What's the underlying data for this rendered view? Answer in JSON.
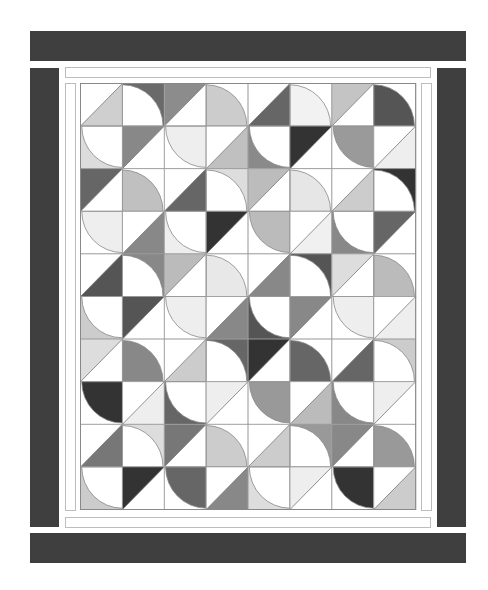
{
  "quilt": {
    "title": "Drunkard's-path style quilt layout",
    "outer_border_color": "#3f3f3f",
    "strip_border_color": "#bdbdbd",
    "grid_line_color": "#9a9a9a",
    "cols": 8,
    "rows": 10,
    "cell_w": 41.9,
    "cell_h": 42.6,
    "legend_types": {
      "HL": "half-square triangle, lower-right colored",
      "HU": "half-square triangle, upper-left colored",
      "QB": "quarter circle centered bottom-left",
      "QT": "quarter circle centered top-right"
    },
    "cells": [
      [
        {
          "t": "HL",
          "c": "#cfcfcf"
        },
        {
          "t": "QB",
          "bg": "#6a6a6a",
          "c": "#ffffff"
        },
        {
          "t": "HU",
          "c": "#8c8c8c"
        },
        {
          "t": "QB",
          "bg": "#ffffff",
          "c": "#cccccc"
        },
        {
          "t": "HL",
          "c": "#666666"
        },
        {
          "t": "QB",
          "bg": "#ffffff",
          "c": "#f2f2f2"
        },
        {
          "t": "HU",
          "c": "#c4c4c4"
        },
        {
          "t": "QB",
          "bg": "#ffffff",
          "c": "#555555"
        }
      ],
      [
        {
          "t": "QT",
          "bg": "#dcdcdc",
          "c": "#ffffff"
        },
        {
          "t": "HU",
          "c": "#888888"
        },
        {
          "t": "QT",
          "bg": "#ffffff",
          "c": "#eeeeee"
        },
        {
          "t": "HL",
          "c": "#c0c0c0"
        },
        {
          "t": "QT",
          "bg": "#8a8a8a",
          "c": "#ffffff"
        },
        {
          "t": "HU",
          "c": "#333333"
        },
        {
          "t": "QT",
          "bg": "#ffffff",
          "c": "#9a9a9a"
        },
        {
          "t": "HL",
          "c": "#eeeeee"
        }
      ],
      [
        {
          "t": "HU",
          "c": "#666666"
        },
        {
          "t": "QB",
          "bg": "#ffffff",
          "c": "#c0c0c0"
        },
        {
          "t": "HL",
          "c": "#666666"
        },
        {
          "t": "QB",
          "bg": "#dddddd",
          "c": "#ffffff"
        },
        {
          "t": "HU",
          "c": "#bcbcbc"
        },
        {
          "t": "QB",
          "bg": "#ffffff",
          "c": "#e6e6e6"
        },
        {
          "t": "HL",
          "c": "#cccccc"
        },
        {
          "t": "QB",
          "bg": "#333333",
          "c": "#ffffff"
        }
      ],
      [
        {
          "t": "QT",
          "bg": "#ffffff",
          "c": "#eeeeee"
        },
        {
          "t": "HL",
          "c": "#888888"
        },
        {
          "t": "QT",
          "bg": "#eeeeee",
          "c": "#ffffff"
        },
        {
          "t": "HU",
          "c": "#333333"
        },
        {
          "t": "QT",
          "bg": "#ffffff",
          "c": "#bbbbbb"
        },
        {
          "t": "HL",
          "c": "#f0f0f0"
        },
        {
          "t": "QT",
          "bg": "#888888",
          "c": "#ffffff"
        },
        {
          "t": "HU",
          "c": "#666666"
        }
      ],
      [
        {
          "t": "HL",
          "c": "#555555"
        },
        {
          "t": "QB",
          "bg": "#888888",
          "c": "#ffffff"
        },
        {
          "t": "HU",
          "c": "#bbbbbb"
        },
        {
          "t": "QB",
          "bg": "#ffffff",
          "c": "#e8e8e8"
        },
        {
          "t": "HL",
          "c": "#888888"
        },
        {
          "t": "QB",
          "bg": "#555555",
          "c": "#ffffff"
        },
        {
          "t": "HU",
          "c": "#dddddd"
        },
        {
          "t": "QB",
          "bg": "#ffffff",
          "c": "#bbbbbb"
        }
      ],
      [
        {
          "t": "QT",
          "bg": "#cccccc",
          "c": "#ffffff"
        },
        {
          "t": "HU",
          "c": "#555555"
        },
        {
          "t": "QT",
          "bg": "#ffffff",
          "c": "#eeeeee"
        },
        {
          "t": "HL",
          "c": "#888888"
        },
        {
          "t": "QT",
          "bg": "#555555",
          "c": "#ffffff"
        },
        {
          "t": "HU",
          "c": "#888888"
        },
        {
          "t": "QT",
          "bg": "#ffffff",
          "c": "#eeeeee"
        },
        {
          "t": "HL",
          "c": "#eeeeee"
        }
      ],
      [
        {
          "t": "HU",
          "c": "#dddddd"
        },
        {
          "t": "QB",
          "bg": "#ffffff",
          "c": "#888888"
        },
        {
          "t": "HL",
          "c": "#cccccc"
        },
        {
          "t": "QB",
          "bg": "#666666",
          "c": "#ffffff"
        },
        {
          "t": "HU",
          "c": "#333333"
        },
        {
          "t": "QB",
          "bg": "#ffffff",
          "c": "#666666"
        },
        {
          "t": "HL",
          "c": "#666666"
        },
        {
          "t": "QB",
          "bg": "#cccccc",
          "c": "#ffffff"
        }
      ],
      [
        {
          "t": "QT",
          "bg": "#ffffff",
          "c": "#333333"
        },
        {
          "t": "HL",
          "c": "#eeeeee"
        },
        {
          "t": "QT",
          "bg": "#666666",
          "c": "#ffffff"
        },
        {
          "t": "HU",
          "c": "#eeeeee"
        },
        {
          "t": "QT",
          "bg": "#ffffff",
          "c": "#999999"
        },
        {
          "t": "HL",
          "c": "#bbbbbb"
        },
        {
          "t": "QT",
          "bg": "#888888",
          "c": "#ffffff"
        },
        {
          "t": "HU",
          "c": "#eeeeee"
        }
      ],
      [
        {
          "t": "HL",
          "c": "#777777"
        },
        {
          "t": "QB",
          "bg": "#dddddd",
          "c": "#ffffff"
        },
        {
          "t": "HU",
          "c": "#777777"
        },
        {
          "t": "QB",
          "bg": "#ffffff",
          "c": "#cccccc"
        },
        {
          "t": "HL",
          "c": "#cccccc"
        },
        {
          "t": "QB",
          "bg": "#999999",
          "c": "#ffffff"
        },
        {
          "t": "HU",
          "c": "#888888"
        },
        {
          "t": "QB",
          "bg": "#ffffff",
          "c": "#999999"
        }
      ],
      [
        {
          "t": "QT",
          "bg": "#cccccc",
          "c": "#ffffff"
        },
        {
          "t": "HU",
          "c": "#333333"
        },
        {
          "t": "QT",
          "bg": "#ffffff",
          "c": "#666666"
        },
        {
          "t": "HL",
          "c": "#888888"
        },
        {
          "t": "QT",
          "bg": "#dddddd",
          "c": "#ffffff"
        },
        {
          "t": "HU",
          "c": "#eeeeee"
        },
        {
          "t": "QT",
          "bg": "#ffffff",
          "c": "#333333"
        },
        {
          "t": "HL",
          "c": "#cccccc"
        }
      ]
    ]
  }
}
